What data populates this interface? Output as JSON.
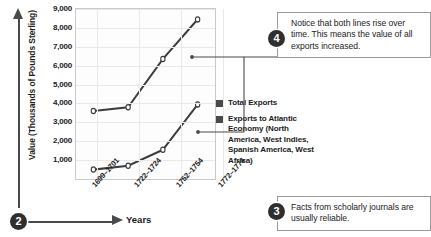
{
  "chart_data": {
    "type": "line",
    "title": "",
    "xlabel": "Years",
    "ylabel": "Value (Thousands of Pounds Sterling)",
    "categories": [
      "1699–1701",
      "1722–1724",
      "1752–1754",
      "1772–1774"
    ],
    "ylim": [
      0,
      9000
    ],
    "yticks": [
      1000,
      2000,
      3000,
      4000,
      5000,
      6000,
      7000,
      8000,
      9000
    ],
    "ytick_labels": [
      "1,000",
      "2,000",
      "3,000",
      "4,000",
      "5,000",
      "6,000",
      "7,000",
      "8,000",
      "9,000"
    ],
    "grid": true,
    "legend_position": "right",
    "series": [
      {
        "name": "Total Exports",
        "values": [
          3600,
          3800,
          6350,
          8450
        ],
        "color": "#3c3c3c",
        "marker": "open-circle"
      },
      {
        "name": "Exports to Atlantic Economy (North America, West Indies, Spanish America, West Africa)",
        "values": [
          500,
          700,
          1550,
          3950
        ],
        "color": "#3c3c3c",
        "marker": "open-circle"
      }
    ]
  },
  "axes": {
    "y_title": "Value (Thousands of Pounds Sterling)",
    "x_title": "Years"
  },
  "legend": {
    "items": [
      {
        "label": "Total Exports",
        "swatch_color": "#4a4a4a"
      },
      {
        "label": "Exports to Atlantic Economy (North America, West Indies, Spanish America, West Africa)",
        "swatch_color": "#4a4a4a"
      }
    ]
  },
  "callouts": [
    {
      "number": "2",
      "text": "",
      "target": "axis-titles"
    },
    {
      "number": "3",
      "text": "Facts from scholarly journals are usually reliable."
    },
    {
      "number": "4",
      "text": "Notice that both lines rise over time. This means the value of all exports increased."
    }
  ],
  "markers": {
    "two": "2",
    "three": "3",
    "four": "4"
  },
  "colors": {
    "line": "#3c3c3c",
    "grid": "#e9e9e9",
    "frame": "#c9c9c9",
    "marker_circle": "#2f2f2f",
    "box_border": "#9a9a9a",
    "arrow": "#4a4a4a"
  }
}
